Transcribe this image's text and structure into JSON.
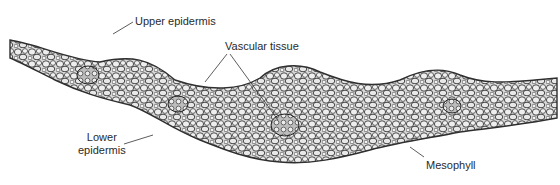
{
  "figure": {
    "labels": {
      "upper_epidermis": "Upper epidermis",
      "vascular_tissue": "Vascular tissue",
      "lower_epidermis_line1": "Lower",
      "lower_epidermis_line2": "epidermis",
      "mesophyll": "Mesophyll"
    },
    "colors": {
      "cell_fill": "#e6e6e6",
      "cell_wall": "#3a3a3a",
      "background": "#ffffff",
      "leader_line": "#333333"
    }
  }
}
